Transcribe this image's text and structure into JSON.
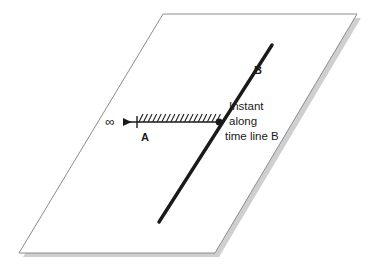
{
  "figure": {
    "title_text": "",
    "background_color": "#ffffff"
  },
  "plane": {
    "name": "spacelike-hypersurface-plane",
    "fill_color": "#ffffff",
    "stroke_color": "#8c8c8c",
    "shadow_color": "#cfcfcf",
    "corners": [
      {
        "x": 163,
        "y": 14
      },
      {
        "x": 357,
        "y": 14
      },
      {
        "x": 215,
        "y": 253
      },
      {
        "x": 19,
        "y": 253
      }
    ]
  },
  "time_line_b": {
    "label": "B",
    "color": "#1a1a1a",
    "stroke_width": 3.4,
    "start": {
      "x": 272,
      "y": 45
    },
    "end": {
      "x": 159,
      "y": 222
    },
    "label_position": {
      "x": 258,
      "y": 74
    }
  },
  "ray_a": {
    "label": "A",
    "color": "#1a1a1a",
    "stroke_width": 1.3,
    "y": 122,
    "arrow_tip_x": 119,
    "tick_x": 137,
    "end_x": 219,
    "hatch_count": 18,
    "hatch_height": 8,
    "hatch_slant": 4,
    "label_position": {
      "x": 145,
      "y": 141
    }
  },
  "infinity_marker": {
    "symbol": "∞",
    "position": {
      "x": 110,
      "y": 126
    }
  },
  "intersection_point": {
    "name": "instant-dot",
    "position": {
      "x": 219,
      "y": 122
    },
    "radius": 3.4,
    "color": "#1a1a1a"
  },
  "caption": {
    "lines": [
      "Instant",
      "along",
      "time line B"
    ],
    "anchor": {
      "x": 229,
      "y": 110
    },
    "line_height": 15
  }
}
